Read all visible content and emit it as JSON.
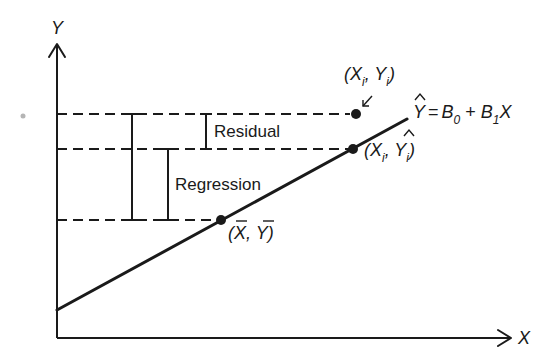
{
  "diagram": {
    "axes": {
      "y_label": "Y",
      "x_label": "X"
    },
    "labels": {
      "residual": "Residual",
      "regression": "Regression"
    },
    "equation": {
      "lhs": "Y",
      "lhs_hat": true,
      "equals": "=",
      "b0": "B",
      "b0_sub": "0",
      "plus": "+",
      "b1": "B",
      "b1_sub": "1",
      "x": "X"
    },
    "points": [
      {
        "id": "observed",
        "label_open": "(X",
        "label_sub1": "i",
        "label_sep": ", Y",
        "label_sub2": "i",
        "label_close": ")",
        "hat_on_y": false
      },
      {
        "id": "predicted",
        "label_open": "(X",
        "label_sub1": "i",
        "label_sep": ", Y",
        "label_sub2": "i",
        "label_close": ")",
        "hat_on_y": true
      },
      {
        "id": "mean",
        "label_open": "(X",
        "label_sep": ", Y",
        "label_close": ")",
        "bar_on_x": true,
        "bar_on_y": true
      }
    ]
  }
}
